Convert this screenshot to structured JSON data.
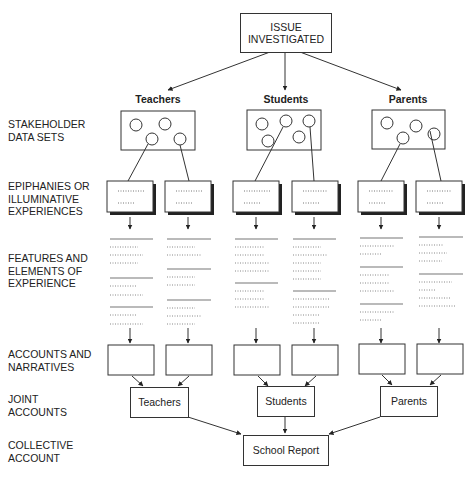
{
  "root": {
    "label": "ISSUE\nINVESTIGATED"
  },
  "row_labels": [
    "STAKEHOLDER\nDATA SETS",
    "EPIPHANIES OR\nILLUMINATIVE\nEXPERIENCES",
    "FEATURES AND\nELEMENTS OF\nEXPERIENCE",
    "ACCOUNTS AND\nNARRATIVES",
    "JOINT\nACCOUNTS",
    "COLLECTIVE\nACCOUNT"
  ],
  "groups": [
    {
      "name": "Teachers",
      "joint": "Teachers"
    },
    {
      "name": "Students",
      "joint": "Students"
    },
    {
      "name": "Parents",
      "joint": "Parents"
    }
  ],
  "collective": {
    "label": "School Report"
  }
}
